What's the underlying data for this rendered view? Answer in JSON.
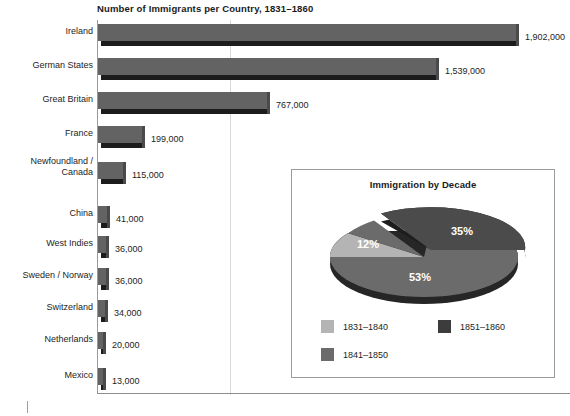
{
  "chart_data": [
    {
      "type": "bar",
      "orientation": "horizontal",
      "title": "Number of Immigrants per Country, 1831–1860",
      "xlabel": "",
      "ylabel": "",
      "grid": true,
      "legend": "none",
      "xlim": [
        0,
        2000000
      ],
      "categories": [
        "Ireland",
        "German States",
        "Great Britain",
        "France",
        "Newfoundland /\nCanada",
        "China",
        "West Indies",
        "Sweden / Norway",
        "Switzerland",
        "Netherlands",
        "Mexico"
      ],
      "values": [
        1902000,
        1539000,
        767000,
        199000,
        115000,
        41000,
        36000,
        36000,
        34000,
        20000,
        13000
      ],
      "value_labels": [
        "1,902,000",
        "1,539,000",
        "767,000",
        "199,000",
        "115,000",
        "41,000",
        "36,000",
        "36,000",
        "34,000",
        "20,000",
        "13,000"
      ],
      "bar_color": "#636363",
      "bar_shadow_color": "#1c1c1c"
    },
    {
      "type": "pie",
      "title": "Immigration by Decade",
      "exploded_slice": "1851–1860",
      "labels": [
        "1831–1840",
        "1841–1850",
        "1851–1860"
      ],
      "values": [
        12,
        53,
        35
      ],
      "value_labels": [
        "12%",
        "53%",
        "35%"
      ],
      "colors": [
        "#b4b4b4",
        "#6b6b6b",
        "#4b4b4b"
      ],
      "legend_position": "bottom"
    }
  ],
  "bar_chart": {
    "title": "Number of Immigrants per Country, 1831–1860",
    "rows": [
      {
        "category": "Ireland",
        "value_label": "1,902,000"
      },
      {
        "category": "German States",
        "value_label": "1,539,000"
      },
      {
        "category": "Great Britain",
        "value_label": "767,000"
      },
      {
        "category": "France",
        "value_label": "199,000"
      },
      {
        "category": "Newfoundland /\nCanada",
        "value_label": "115,000"
      },
      {
        "category": "China",
        "value_label": "41,000"
      },
      {
        "category": "West Indies",
        "value_label": "36,000"
      },
      {
        "category": "Sweden / Norway",
        "value_label": "36,000"
      },
      {
        "category": "Switzerland",
        "value_label": "34,000"
      },
      {
        "category": "Netherlands",
        "value_label": "20,000"
      },
      {
        "category": "Mexico",
        "value_label": "13,000"
      }
    ]
  },
  "pie_chart": {
    "title": "Immigration by Decade",
    "slices": [
      {
        "label": "35%",
        "series": "1851–1860",
        "color": "#4b4b4b"
      },
      {
        "label": "12%",
        "series": "1831–1840",
        "color": "#b4b4b4"
      },
      {
        "label": "53%",
        "series": "1841–1850",
        "color": "#6b6b6b"
      }
    ],
    "legend": [
      {
        "label": "1831–1840",
        "color": "#b4b4b4"
      },
      {
        "label": "1851–1860",
        "color": "#3c3c3c"
      },
      {
        "label": "1841–1850",
        "color": "#6b6b6b"
      }
    ]
  },
  "colors": {
    "bar_face": "#636363",
    "bar_shadow": "#1c1c1c",
    "axis": "#9a9a9a",
    "inset_border": "#9b9b9b",
    "text": "#1d1d1d"
  }
}
